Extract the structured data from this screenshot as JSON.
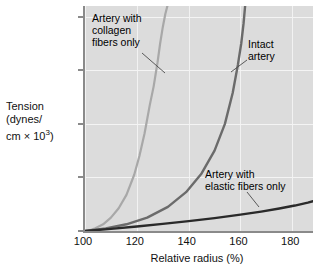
{
  "figure": {
    "background_color": "#ffffff",
    "plot_background_color": "#dcdcdc",
    "axis_color": "#8a8a8a"
  },
  "axes": {
    "x_title": "Relative radius (%)",
    "y_title_line1": "Tension",
    "y_title_line2": "(dynes/",
    "y_title_line3_pre": "cm × 10",
    "y_title_line3_sup": "3",
    "y_title_line3_post": ")",
    "x_ticks": [
      "100",
      "120",
      "140",
      "160",
      "180"
    ],
    "y_ticks": [
      "0",
      "40",
      "80",
      "120",
      "160"
    ]
  },
  "annotations": {
    "collagen": "Artery with\ncollagen\nfibers only",
    "intact": "Intact\nartery",
    "elastic": "Artery with\nelastic fibers only"
  },
  "chart_data": {
    "type": "line",
    "title": "",
    "xlabel": "Relative radius (%)",
    "ylabel": "Tension (dynes/cm × 10^3)",
    "xlim": [
      100,
      188
    ],
    "ylim": [
      0,
      168
    ],
    "xticks": [
      100,
      120,
      140,
      160,
      180
    ],
    "yticks": [
      0,
      40,
      80,
      120,
      160
    ],
    "grid": true,
    "legend": "annotated-inline",
    "series": [
      {
        "name": "Artery with collagen fibers only",
        "color": "#a8a8a8",
        "width": 2.2,
        "x": [
          101,
          104,
          107,
          110,
          113,
          116,
          119,
          121,
          123,
          125,
          126.5,
          128,
          129,
          130,
          131,
          131.8
        ],
        "y": [
          0,
          2,
          5,
          10,
          17,
          27,
          42,
          56,
          73,
          94,
          108,
          126,
          140,
          152,
          162,
          168
        ]
      },
      {
        "name": "Intact artery",
        "color": "#6b6b6b",
        "width": 2.4,
        "x": [
          100,
          108,
          116,
          124,
          132,
          139,
          145,
          150,
          154,
          157,
          159,
          160.3,
          161.2,
          161.8
        ],
        "y": [
          0,
          2,
          5,
          10,
          18,
          29,
          43,
          60,
          80,
          103,
          124,
          140,
          155,
          168
        ]
      },
      {
        "name": "Artery with elastic fibers only",
        "color": "#2a2a2a",
        "width": 2.4,
        "x": [
          100,
          110,
          120,
          130,
          140,
          150,
          160,
          168,
          175,
          181,
          186,
          188
        ],
        "y": [
          0,
          1.6,
          3.4,
          5.3,
          7.4,
          9.6,
          12.2,
          14.5,
          16.8,
          19.0,
          21.2,
          22.2
        ]
      }
    ],
    "leader_lines": [
      {
        "for": "Artery with collagen fibers only",
        "from": [
          142,
          53
        ],
        "to": [
          165,
          73
        ]
      },
      {
        "for": "Intact artery",
        "from": [
          247,
          60
        ],
        "to": [
          231,
          72
        ]
      },
      {
        "for": "Artery with elastic fibers only",
        "from": [
          247,
          192
        ],
        "to": [
          259,
          207
        ]
      }
    ]
  }
}
